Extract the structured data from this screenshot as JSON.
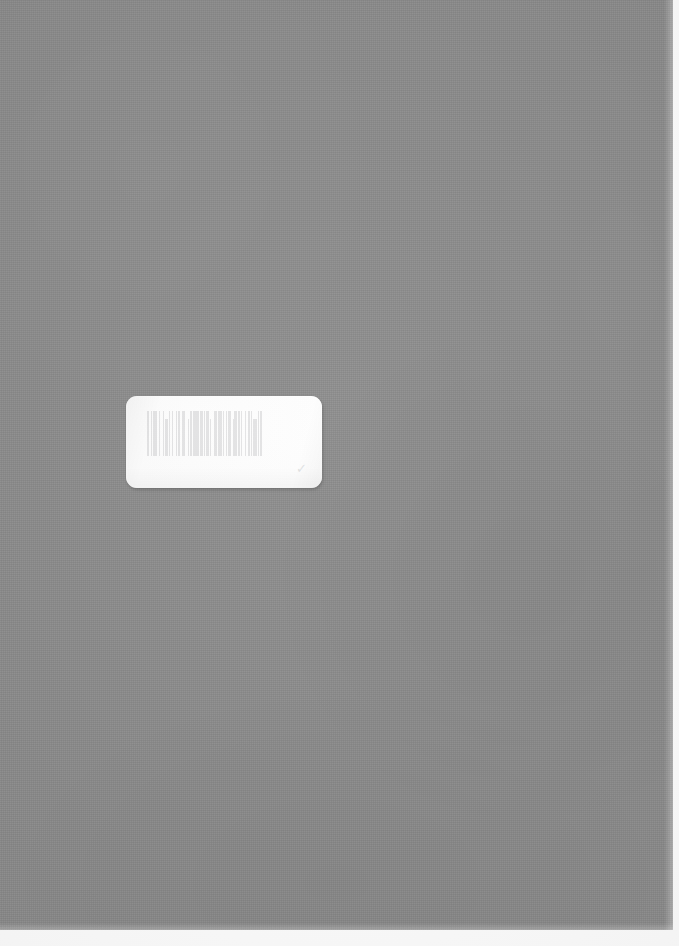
{
  "page": {
    "kind": "scanned-book-cover",
    "width": 679,
    "height": 946,
    "background_color": "#ffffff"
  },
  "cover": {
    "name": "gray-book-cover",
    "color": "#8d8d8d",
    "width": 673,
    "height": 930,
    "texture": "fine-cloth-grain",
    "edge_highlight_color": "#b0b0b0"
  },
  "label": {
    "name": "barcode-label",
    "color": "#fdfdfd",
    "x": 126,
    "y": 396,
    "width": 196,
    "height": 92,
    "corner_radius": 11,
    "shadow_color": "rgba(0,0,0,0.17)",
    "barcode": {
      "icon": "barcode-icon",
      "symbology": "code-39",
      "digits": "",
      "legible": false,
      "bar_color": "#7f8287",
      "opacity": 0.2,
      "pattern": [
        3,
        2,
        1,
        2,
        5,
        2,
        2,
        3,
        1,
        2,
        4,
        1,
        2,
        2,
        1,
        4,
        2,
        1,
        3,
        2,
        1,
        1,
        2,
        4,
        1,
        2,
        2,
        1,
        5,
        1,
        2,
        2,
        3,
        1,
        1,
        2,
        4,
        1,
        2,
        3,
        1,
        1,
        2,
        2,
        5,
        1,
        1,
        3,
        2,
        1,
        4,
        2,
        1,
        1,
        3,
        2,
        2,
        1,
        2,
        4,
        1,
        3,
        2,
        1,
        1,
        2,
        5,
        2,
        1,
        1,
        3,
        2
      ]
    },
    "corner_mark": "✓"
  }
}
